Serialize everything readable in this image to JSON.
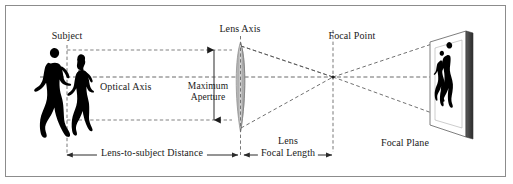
{
  "diagram": {
    "background_color": "#ffffff",
    "border_color": "#8c8c8c",
    "line_color": "#4d4d4d",
    "text_color": "#1a1a1a",
    "silhouette_color": "#000000"
  },
  "labels": {
    "subject": "Subject",
    "optical_axis": "Optical Axis",
    "lens_axis": "Lens Axis",
    "maximum_line1": "Maximum",
    "maximum_line2": "Aperture",
    "focal_point": "Focal Point",
    "focal_plane": "Focal Plane",
    "lens": "Lens",
    "focal_length": "Focal Length",
    "lens_to_subject_distance": "Lens-to-subject Distance"
  },
  "measurements": [
    {
      "name": "lens-to-subject-distance",
      "label": "Lens-to-subject Distance",
      "orientation": "horizontal",
      "arrow_ends": "both"
    },
    {
      "name": "focal-length",
      "label": "Focal Length",
      "orientation": "horizontal",
      "arrow_ends": "both"
    },
    {
      "name": "maximum-aperture",
      "label": "Maximum Aperture",
      "orientation": "vertical",
      "arrow_ends": "both"
    }
  ],
  "elements": {
    "subject_figures": [
      "walking-man-silhouette",
      "walking-woman-silhouette"
    ],
    "lens_type": "biconvex",
    "focal_plane_image": "inverted-subject-silhouettes",
    "ray_count": 4,
    "axis_style": "dashed"
  }
}
